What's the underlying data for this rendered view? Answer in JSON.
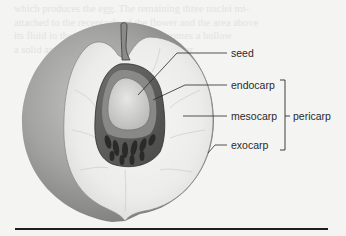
{
  "figure": {
    "labels": {
      "seed": "seed",
      "endocarp": "endocarp",
      "mesocarp": "mesocarp",
      "exocarp": "exocarp",
      "pericarp": "pericarp"
    },
    "colors": {
      "background": "#f4f4f3",
      "skin": "#9a9a9a",
      "flesh": "#eeeeec",
      "pit": "#5a5a5a",
      "seed": "#d8d8d6",
      "leader_line": "#2a2a2a",
      "rule": "#1e1e1e"
    }
  },
  "bleed_through_text": [
    "which produces the egg. The remaining three nuclei mi-",
    "attached to the receptacle of the flower and the area above",
    "its fluid in the center of the ovule becomes a hollow",
    "a solid and surrounded by the seed coat, or"
  ]
}
